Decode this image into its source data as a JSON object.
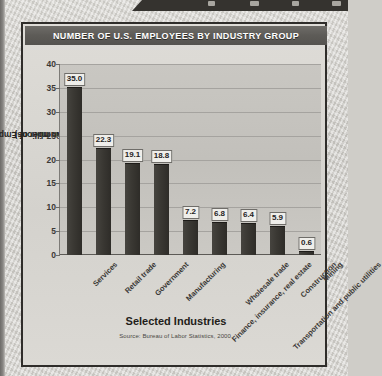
{
  "page": {
    "banner_marks": 3
  },
  "chart_title": "NUMBER OF U.S. EMPLOYEES BY INDUSTRY GROUP",
  "axis": {
    "ylabel_line1": "Number of Employees",
    "ylabel_line2": "(in millions)",
    "xlabel": "Selected Industries"
  },
  "source": "Source: Bureau of Labor Statistics, 2000.",
  "colors": {
    "bar": "#332f2b",
    "title_bar": "#5d5b57",
    "plot_bg": "#c5c3be",
    "frame": "#2f2d2a",
    "grid": "#a5a39f",
    "text": "#26241f"
  },
  "chart_data": {
    "type": "bar",
    "title": "NUMBER OF U.S. EMPLOYEES BY INDUSTRY GROUP",
    "xlabel": "Selected Industries",
    "ylabel": "Number of Employees (in millions)",
    "ylim": [
      0,
      40
    ],
    "yticks": [
      0,
      5,
      10,
      15,
      20,
      25,
      30,
      35,
      40
    ],
    "ytick_labels": [
      "0",
      "5",
      "10",
      "15",
      "20",
      "25",
      "30",
      "35",
      "40"
    ],
    "grid": true,
    "legend": "none",
    "categories": [
      "Services",
      "Retail trade",
      "Government",
      "Manufacturing",
      "Finance, insurance, real estate",
      "Wholesale trade",
      "Transportation and public utilities",
      "Construction",
      "Mining"
    ],
    "values": [
      35.0,
      22.3,
      19.1,
      18.8,
      7.2,
      6.8,
      6.4,
      5.9,
      0.6
    ],
    "value_labels": [
      "35.0",
      "22.3",
      "19.1",
      "18.8",
      "7.2",
      "6.8",
      "6.4",
      "5.9",
      "0.6"
    ],
    "source": "Source: Bureau of Labor Statistics, 2000."
  }
}
